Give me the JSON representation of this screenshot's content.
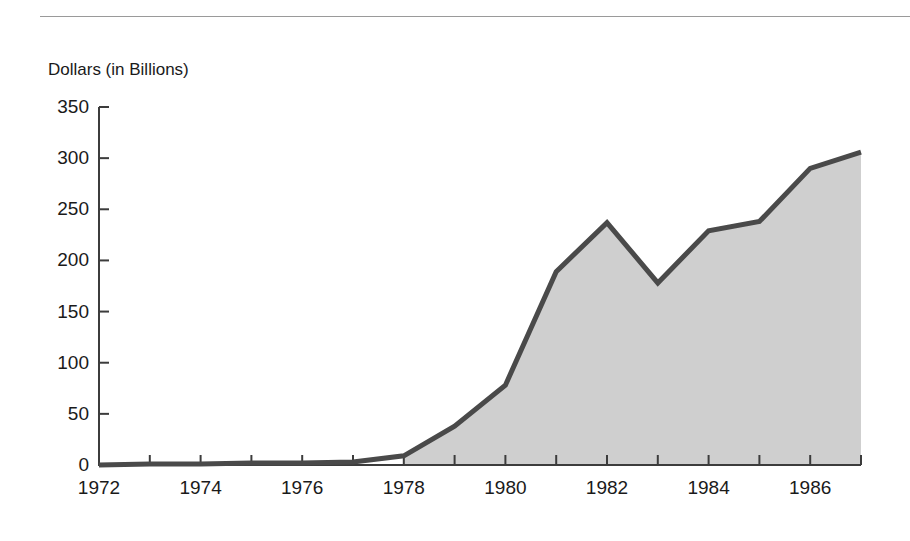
{
  "figure": {
    "rule": "horizontal-rule",
    "background_color": "#ffffff"
  },
  "chart_data": {
    "type": "area",
    "title": "",
    "subtitle": "",
    "ylabel": "Dollars (in Billions)",
    "xlabel": "",
    "x": [
      1972,
      1973,
      1974,
      1975,
      1976,
      1977,
      1978,
      1979,
      1980,
      1981,
      1982,
      1983,
      1984,
      1985,
      1986,
      1987
    ],
    "values": [
      0,
      1,
      1,
      2,
      2,
      3,
      9,
      38,
      78,
      189,
      237,
      178,
      229,
      238,
      290,
      306
    ],
    "series": [
      {
        "name": "Dollars (in Billions)",
        "values": [
          0,
          1,
          1,
          2,
          2,
          3,
          9,
          38,
          78,
          189,
          237,
          178,
          229,
          238,
          290,
          306
        ]
      }
    ],
    "xlim": [
      1972,
      1987
    ],
    "ylim": [
      0,
      350
    ],
    "ytick_labels": [
      "0",
      "50",
      "100",
      "150",
      "200",
      "250",
      "300",
      "350"
    ],
    "ytick_values": [
      0,
      50,
      100,
      150,
      200,
      250,
      300,
      350
    ],
    "xtick_labels": [
      "1972",
      "1974",
      "1976",
      "1978",
      "1980",
      "1982",
      "1984",
      "1986"
    ],
    "xtick_values": [
      1972,
      1974,
      1976,
      1978,
      1980,
      1982,
      1984,
      1986
    ],
    "xtick_minor_values": [
      1973,
      1975,
      1977,
      1979,
      1981,
      1983,
      1985,
      1987
    ],
    "grid": false,
    "legend": "none",
    "fill_color": "#cfcfcf",
    "line_color": "#4a4a4a",
    "axis_color": "#3c3c3c",
    "fill_start_x": 1978,
    "annotations": []
  }
}
